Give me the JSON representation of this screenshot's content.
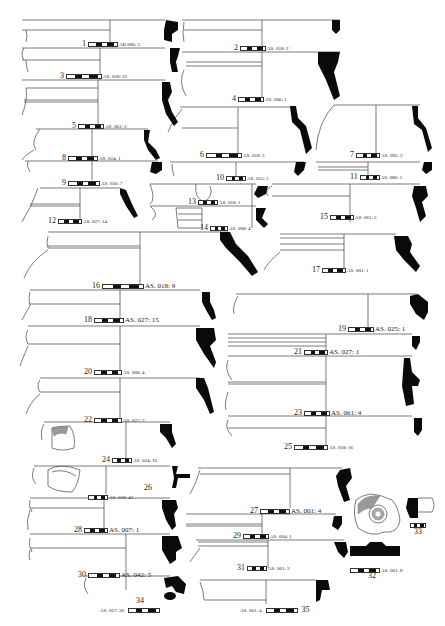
{
  "figure": {
    "type": "archaeological pottery profile plate",
    "page_mark": "",
    "items": [
      {
        "num": "1",
        "code": "AB.006: 3"
      },
      {
        "num": "2",
        "code": "AS. 018: 2"
      },
      {
        "num": "3",
        "code": "AS. 018: 22"
      },
      {
        "num": "4",
        "code": "AS. 006: 1"
      },
      {
        "num": "5",
        "code": "AS. 061: 3"
      },
      {
        "num": "6",
        "code": "AS. 018: 5"
      },
      {
        "num": "7",
        "code": "AS. 095: 2"
      },
      {
        "num": "8",
        "code": "AS. 024: 1"
      },
      {
        "num": "9",
        "code": "AS. 056: 7"
      },
      {
        "num": "10",
        "code": "AS. 015: 1"
      },
      {
        "num": "11",
        "code": "AS. 080: 2"
      },
      {
        "num": "12",
        "code": "AS. 027: 14"
      },
      {
        "num": "13",
        "code": "AS. 018: 1"
      },
      {
        "num": "14",
        "code": "AS. 008: 4"
      },
      {
        "num": "15",
        "code": "AS. 061: 5"
      },
      {
        "num": "16",
        "code": "AS. 018: 9"
      },
      {
        "num": "17",
        "code": "AS. 001: 1"
      },
      {
        "num": "18",
        "code": "AS. 027: 15"
      },
      {
        "num": "19",
        "code": "AS. 025: 1"
      },
      {
        "num": "20",
        "code": "AS. 006: 4"
      },
      {
        "num": "21",
        "code": "AS. 027: 1"
      },
      {
        "num": "22",
        "code": "AS. 027: 7"
      },
      {
        "num": "23",
        "code": "AS. 061: 4"
      },
      {
        "num": "24",
        "code": "AS. 024: 16"
      },
      {
        "num": "25",
        "code": "AS. 018: 16"
      },
      {
        "num": "26",
        "code": "AS. 018: 43"
      },
      {
        "num": "27",
        "code": "AS. 001: 4"
      },
      {
        "num": "28",
        "code": "AS. 007: 1"
      },
      {
        "num": "29",
        "code": "AS. 004: 1"
      },
      {
        "num": "30",
        "code": "AS. 042: 5"
      },
      {
        "num": "31",
        "code": "AS. 061: 2"
      },
      {
        "num": "32",
        "code": "AS. 061: 8"
      },
      {
        "num": "33",
        "code": "AS. 001: 6"
      },
      {
        "num": "34",
        "code": "AS. 027: 30"
      },
      {
        "num": "35",
        "code": "AS. 001: 4"
      }
    ]
  }
}
